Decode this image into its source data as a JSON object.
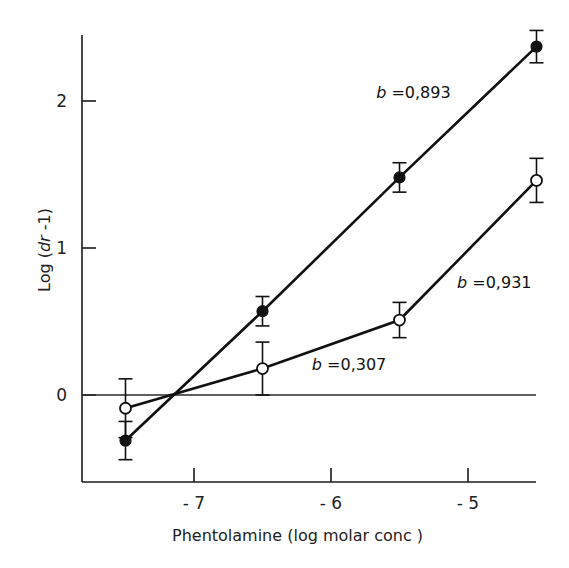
{
  "chart_data": {
    "type": "line",
    "title": "",
    "xlabel": "Phentolamine (log molar conc )",
    "ylabel": "Log (dr -1)",
    "ylabel_parts": {
      "prefix": "Log (",
      "italic": "dr",
      "suffix": " -1)"
    },
    "xlim": [
      -7.82,
      -4.3
    ],
    "ylim": [
      -0.6,
      2.5
    ],
    "x_ticks": [
      -7,
      -6,
      -5
    ],
    "x_tick_labels": [
      "-7",
      "-6",
      "-5"
    ],
    "y_ticks": [
      0,
      1,
      2
    ],
    "y_tick_labels": [
      "0",
      "1",
      "2"
    ],
    "grid": false,
    "reference_line": {
      "y": 0
    },
    "legend": null,
    "series": [
      {
        "name": "filled",
        "marker": "filled-circle",
        "x": [
          -7.5,
          -6.5,
          -5.5,
          -4.5
        ],
        "y": [
          -0.31,
          0.57,
          1.48,
          2.37
        ],
        "error": [
          0.13,
          0.1,
          0.1,
          0.11
        ],
        "annotation": {
          "b_label": "b",
          "value_text": " =0,893",
          "x": -5.67,
          "y": 2.02
        }
      },
      {
        "name": "open",
        "marker": "open-circle",
        "x": [
          -7.5,
          -6.5,
          -5.5,
          -4.5
        ],
        "y": [
          -0.09,
          0.18,
          0.51,
          1.46
        ],
        "error": [
          0.2,
          0.18,
          0.12,
          0.15
        ],
        "annotation_segments": [
          {
            "b_label": "b",
            "value_text": " =0,307",
            "x": -6.14,
            "y": 0.17
          },
          {
            "b_label": "b",
            "value_text": " =0,931",
            "x": -5.08,
            "y": 0.73
          }
        ]
      }
    ]
  }
}
